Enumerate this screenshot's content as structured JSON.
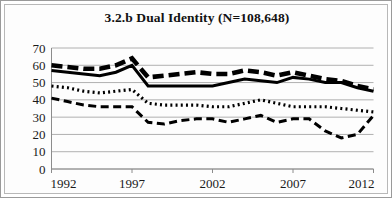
{
  "figure": {
    "title": "3.2.b Dual Identity (N=108,648)",
    "border_color": "#9a9a9a",
    "background": "#ffffff"
  },
  "chart_data": {
    "type": "line",
    "title": "3.2.b Dual Identity (N=108,648)",
    "xlabel": "",
    "ylabel": "",
    "xlim": [
      1992,
      2012
    ],
    "ylim": [
      0,
      70
    ],
    "ytick_values": [
      0,
      10,
      20,
      30,
      40,
      50,
      60,
      70
    ],
    "ytick_labels": [
      "0",
      "10",
      "20",
      "30",
      "40",
      "50",
      "60",
      "70"
    ],
    "xtick_values": [
      1992,
      1997,
      2002,
      2007,
      2012
    ],
    "xtick_labels": [
      "1992",
      "1997",
      "2002",
      "2007",
      "2012"
    ],
    "grid": true,
    "grid_axis": "y",
    "legend": false,
    "legend_position": "none",
    "x": [
      1992,
      1993,
      1994,
      1995,
      1996,
      1997,
      1998,
      1999,
      2000,
      2001,
      2002,
      2003,
      2004,
      2005,
      2006,
      2007,
      2008,
      2009,
      2010,
      2011,
      2012
    ],
    "series": [
      {
        "name": "thick-dashed-series",
        "style": "thick-dashed",
        "dash": "11,5",
        "width": 4.6,
        "color": "#000000",
        "values": [
          60,
          59,
          58,
          58,
          60,
          64,
          53,
          54,
          55,
          56,
          55,
          55,
          57,
          56,
          54,
          56,
          54,
          52,
          51,
          48,
          46
        ]
      },
      {
        "name": "solid-series",
        "style": "solid",
        "dash": "none",
        "width": 3.0,
        "color": "#000000",
        "values": [
          57,
          56,
          55,
          54,
          56,
          60,
          48,
          48,
          48,
          48,
          48,
          50,
          52,
          51,
          50,
          53,
          52,
          50,
          50,
          47,
          45
        ]
      },
      {
        "name": "dotted-series",
        "style": "dotted",
        "dash": "2,3.2",
        "width": 3.2,
        "color": "#000000",
        "values": [
          48,
          47,
          45,
          44,
          45,
          46,
          38,
          37,
          37,
          37,
          36,
          36,
          38,
          40,
          38,
          36,
          36,
          36,
          35,
          34,
          33
        ]
      },
      {
        "name": "thin-dashed-series",
        "style": "thin-dashed",
        "dash": "8,4.5",
        "width": 3.0,
        "color": "#000000",
        "values": [
          41,
          39,
          37,
          36,
          36,
          36,
          27,
          26,
          28,
          29,
          29,
          27,
          29,
          31,
          27,
          29,
          29,
          22,
          18,
          20,
          31
        ]
      }
    ]
  }
}
